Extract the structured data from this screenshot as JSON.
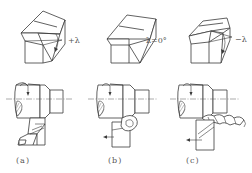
{
  "figure": {
    "panels": [
      {
        "id": "a",
        "caption": "(a)",
        "angle_label": "+λ",
        "angle_type": "positive",
        "chip_form": "chip flows toward machined surface direction"
      },
      {
        "id": "b",
        "caption": "(b)",
        "angle_label": "λ=0°",
        "angle_type": "zero",
        "chip_form": "curled chip"
      },
      {
        "id": "c",
        "caption": "(c)",
        "angle_label": "−λ",
        "angle_type": "negative",
        "chip_form": "helical chip flowing toward workpiece"
      }
    ],
    "colors": {
      "line": "#3a3a3a",
      "background": "#ffffff",
      "text": "#555555"
    }
  }
}
